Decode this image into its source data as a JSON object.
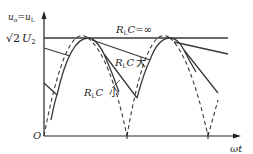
{
  "diagram": {
    "y_axis_label": {
      "main": "u",
      "sub1": "o",
      "eq": "=",
      "main2": "u",
      "sub2": "L"
    },
    "peak_label": {
      "sqrt": "√2",
      "var": "U",
      "sub": "2"
    },
    "origin_label": "O",
    "x_axis_label": "ωt",
    "curves": [
      {
        "label_var": "R",
        "label_sub": "L",
        "label_c": "C",
        "label_suffix": "=∞",
        "style": "solid-horizontal"
      },
      {
        "label_var": "R",
        "label_sub": "L",
        "label_c": "C",
        "label_suffix": "大",
        "style": "slow-decay"
      },
      {
        "label_var": "R",
        "label_sub": "L",
        "label_c": "C",
        "label_suffix": "小",
        "style": "fast-decay"
      }
    ],
    "colors": {
      "line": "#3a3a3a",
      "axis": "#222222",
      "background": "#ffffff"
    }
  }
}
